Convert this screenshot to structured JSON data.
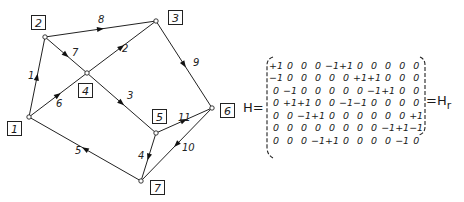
{
  "graph": {
    "nodes": [
      {
        "id": "1",
        "x": 29,
        "y": 117,
        "label": "1",
        "lx": 7,
        "ly": 121
      },
      {
        "id": "2",
        "x": 45,
        "y": 37,
        "label": "2",
        "lx": 31,
        "ly": 15
      },
      {
        "id": "3",
        "x": 156,
        "y": 21,
        "label": "3",
        "lx": 168,
        "ly": 10
      },
      {
        "id": "4",
        "x": 87,
        "y": 73,
        "label": "4",
        "lx": 78,
        "ly": 83
      },
      {
        "id": "5",
        "x": 156,
        "y": 133,
        "label": "5",
        "lx": 152,
        "ly": 109
      },
      {
        "id": "6",
        "x": 212,
        "y": 108,
        "label": "6",
        "lx": 220,
        "ly": 103
      },
      {
        "id": "7",
        "x": 141,
        "y": 181,
        "label": "7",
        "lx": 150,
        "ly": 180
      }
    ],
    "edges": [
      {
        "label": "1",
        "from": "1",
        "to": "2",
        "lx": 28,
        "ly": 70
      },
      {
        "label": "2",
        "from": "4",
        "to": "3",
        "lx": 122,
        "ly": 43
      },
      {
        "label": "3",
        "from": "4",
        "to": "5",
        "lx": 127,
        "ly": 90
      },
      {
        "label": "4",
        "from": "5",
        "to": "7",
        "lx": 138,
        "ly": 150
      },
      {
        "label": "5",
        "from": "7",
        "to": "1",
        "lx": 75,
        "ly": 145
      },
      {
        "label": "6",
        "from": "1",
        "to": "4",
        "lx": 56,
        "ly": 98
      },
      {
        "label": "7",
        "from": "2",
        "to": "4",
        "lx": 72,
        "ly": 47
      },
      {
        "label": "8",
        "from": "2",
        "to": "3",
        "lx": 98,
        "ly": 14
      },
      {
        "label": "9",
        "from": "3",
        "to": "6",
        "lx": 193,
        "ly": 57
      },
      {
        "label": "10",
        "from": "6",
        "to": "7",
        "lx": 182,
        "ly": 142
      },
      {
        "label": "11",
        "from": "5",
        "to": "6",
        "lx": 178,
        "ly": 112
      }
    ]
  },
  "matrix": {
    "left_label": "H=",
    "right_label": "=H",
    "right_label_sub": "r",
    "rows": [
      [
        "+1",
        "0",
        "0",
        "0",
        "-1",
        "+1",
        "0",
        "0",
        "0",
        "0",
        "0"
      ],
      [
        "-1",
        "0",
        "0",
        "0",
        "0",
        "0",
        "+1",
        "+1",
        "0",
        "0",
        "0"
      ],
      [
        "0",
        "-1",
        "0",
        "0",
        "0",
        "0",
        "0",
        "-1",
        "+1",
        "0",
        "0"
      ],
      [
        "0",
        "+1",
        "+1",
        "0",
        "0",
        "-1",
        "-1",
        "0",
        "0",
        "0",
        "0"
      ],
      [
        "0",
        "0",
        "-1",
        "+1",
        "0",
        "0",
        "0",
        "0",
        "0",
        "0",
        "+1"
      ],
      [
        "0",
        "0",
        "0",
        "0",
        "0",
        "0",
        "0",
        "0",
        "-1",
        "+1",
        "-1"
      ],
      [
        "0",
        "0",
        "0",
        "-1",
        "+1",
        "0",
        "0",
        "0",
        "0",
        "-1",
        "0"
      ]
    ],
    "reduced_rows": 6
  }
}
